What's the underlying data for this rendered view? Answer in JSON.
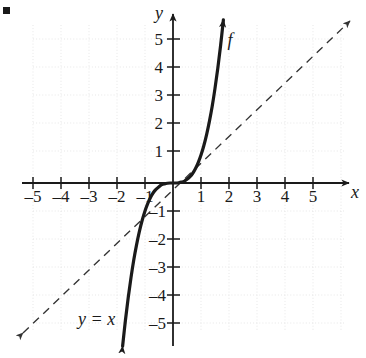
{
  "figure": {
    "kind": "cartesian-graph",
    "bullet_marker": "▪",
    "background_color": "#ffffff",
    "ink_color": "#1a1a1a",
    "grid_color": "#e2e2e2"
  },
  "labels": {
    "y_axis": "y",
    "x_axis": "x",
    "function": "f",
    "identity_line": "y = x"
  },
  "chart_data": {
    "type": "line",
    "title": "",
    "xlabel": "x",
    "ylabel": "y",
    "xlim": [
      -6.2,
      6.4
    ],
    "ylim": [
      -6.0,
      6.2
    ],
    "grid": true,
    "grid_step": 1,
    "legend": "none",
    "x_ticks": [
      -5,
      -4,
      -3,
      -2,
      -1,
      1,
      2,
      3,
      4,
      5
    ],
    "y_ticks": [
      -5,
      -4,
      -3,
      -2,
      -1,
      1,
      2,
      3,
      4,
      5
    ],
    "x_tick_labels": [
      "–5",
      "–4",
      "–3",
      "–2",
      "–1",
      "1",
      "2",
      "3",
      "4",
      "5"
    ],
    "y_tick_labels": [
      "–5",
      "–4",
      "–3",
      "–2",
      "–1",
      "1",
      "2",
      "3",
      "4",
      "5"
    ],
    "series": [
      {
        "name": "f",
        "style": "solid",
        "width": 3.2,
        "arrows": "both",
        "description": "cubic-like increasing curve through the origin with a flat (horizontal) inflection at (0,0)",
        "points": [
          [
            -1.8,
            -5.83
          ],
          [
            -1.7,
            -4.91
          ],
          [
            -1.6,
            -4.1
          ],
          [
            -1.5,
            -3.38
          ],
          [
            -1.4,
            -2.74
          ],
          [
            -1.3,
            -2.2
          ],
          [
            -1.2,
            -1.73
          ],
          [
            -1.1,
            -1.33
          ],
          [
            -1.0,
            -1.0
          ],
          [
            -0.9,
            -0.73
          ],
          [
            -0.8,
            -0.51
          ],
          [
            -0.7,
            -0.34
          ],
          [
            -0.6,
            -0.22
          ],
          [
            -0.5,
            -0.13
          ],
          [
            -0.4,
            -0.06
          ],
          [
            -0.3,
            -0.03
          ],
          [
            -0.2,
            -0.01
          ],
          [
            -0.1,
            0.0
          ],
          [
            0.0,
            0.0
          ],
          [
            0.1,
            0.0
          ],
          [
            0.2,
            0.01
          ],
          [
            0.3,
            0.03
          ],
          [
            0.4,
            0.06
          ],
          [
            0.5,
            0.13
          ],
          [
            0.6,
            0.22
          ],
          [
            0.7,
            0.34
          ],
          [
            0.8,
            0.51
          ],
          [
            0.9,
            0.73
          ],
          [
            1.0,
            1.0
          ],
          [
            1.1,
            1.33
          ],
          [
            1.2,
            1.73
          ],
          [
            1.3,
            2.2
          ],
          [
            1.4,
            2.74
          ],
          [
            1.5,
            3.38
          ],
          [
            1.6,
            4.1
          ],
          [
            1.7,
            4.91
          ],
          [
            1.8,
            5.83
          ]
        ]
      },
      {
        "name": "y = x",
        "style": "dashed",
        "width": 1.3,
        "arrows": "both",
        "description": "identity reference line",
        "points": [
          [
            -6.0,
            -6.0
          ],
          [
            6.0,
            6.0
          ]
        ]
      }
    ]
  }
}
